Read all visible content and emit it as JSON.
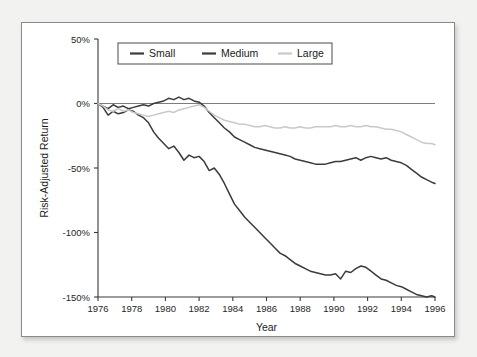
{
  "chart_data": {
    "type": "line",
    "title": "",
    "xlabel": "Year",
    "ylabel": "Risk-Adjusted Return",
    "xlim": [
      1976,
      1996
    ],
    "ylim": [
      -150,
      50
    ],
    "grid": false,
    "legend_position": "top-left-inside",
    "zero_reference_line": true,
    "x_ticks": [
      1976,
      1978,
      1980,
      1982,
      1984,
      1986,
      1988,
      1990,
      1992,
      1994,
      1996
    ],
    "x_tick_labels": [
      "1976",
      "1978",
      "1980",
      "1982",
      "1984",
      "1986",
      "1988",
      "1990",
      "1992",
      "1994",
      "1996"
    ],
    "y_ticks": [
      50,
      0,
      -50,
      -100,
      -150
    ],
    "y_tick_labels": [
      "50%",
      "0%",
      "-50%",
      "-100%",
      "-150%"
    ],
    "series": [
      {
        "name": "Small",
        "color": "#3b3b3b",
        "x": [
          1976.0,
          1976.3,
          1976.6,
          1976.9,
          1977.2,
          1977.5,
          1977.8,
          1978.1,
          1978.4,
          1978.7,
          1979.0,
          1979.3,
          1979.6,
          1979.9,
          1980.2,
          1980.5,
          1980.8,
          1981.1,
          1981.4,
          1981.7,
          1982.0,
          1982.3,
          1982.6,
          1982.9,
          1983.2,
          1983.5,
          1983.8,
          1984.1,
          1984.4,
          1984.7,
          1985.0,
          1985.3,
          1985.6,
          1985.9,
          1986.2,
          1986.5,
          1986.8,
          1987.1,
          1987.4,
          1987.7,
          1988.0,
          1988.3,
          1988.6,
          1988.9,
          1989.2,
          1989.5,
          1989.8,
          1990.1,
          1990.4,
          1990.7,
          1991.0,
          1991.3,
          1991.6,
          1991.9,
          1992.2,
          1992.5,
          1992.8,
          1993.1,
          1993.4,
          1993.7,
          1994.0,
          1994.3,
          1994.6,
          1994.9,
          1995.2,
          1995.5,
          1995.8,
          1996.0
        ],
        "y": [
          0,
          -3,
          -9,
          -6,
          -8,
          -7,
          -5,
          -6,
          -9,
          -11,
          -15,
          -22,
          -27,
          -31,
          -35,
          -33,
          -38,
          -44,
          -40,
          -42,
          -41,
          -45,
          -52,
          -50,
          -55,
          -62,
          -70,
          -78,
          -83,
          -88,
          -92,
          -96,
          -100,
          -104,
          -108,
          -112,
          -116,
          -118,
          -121,
          -124,
          -126,
          -128,
          -130,
          -131,
          -132,
          -133,
          -133,
          -132,
          -136,
          -130,
          -131,
          -128,
          -126,
          -127,
          -130,
          -133,
          -136,
          -137,
          -139,
          -141,
          -142,
          -144,
          -146,
          -148,
          -149,
          -150,
          -149,
          -150
        ]
      },
      {
        "name": "Medium",
        "color": "#3b3b3b",
        "x": [
          1976.0,
          1976.3,
          1976.6,
          1976.9,
          1977.2,
          1977.5,
          1977.8,
          1978.1,
          1978.4,
          1978.7,
          1979.0,
          1979.3,
          1979.6,
          1979.9,
          1980.2,
          1980.5,
          1980.8,
          1981.1,
          1981.4,
          1981.7,
          1982.0,
          1982.3,
          1982.6,
          1982.9,
          1983.2,
          1983.5,
          1983.8,
          1984.1,
          1984.4,
          1984.7,
          1985.0,
          1985.3,
          1985.6,
          1985.9,
          1986.2,
          1986.5,
          1986.8,
          1987.1,
          1987.4,
          1987.7,
          1988.0,
          1988.3,
          1988.6,
          1988.9,
          1989.2,
          1989.5,
          1989.8,
          1990.1,
          1990.4,
          1990.7,
          1991.0,
          1991.3,
          1991.6,
          1991.9,
          1992.2,
          1992.5,
          1992.8,
          1993.1,
          1993.4,
          1993.7,
          1994.0,
          1994.3,
          1994.6,
          1994.9,
          1995.2,
          1995.5,
          1995.8,
          1996.0
        ],
        "y": [
          0,
          -2,
          -4,
          -1,
          -3,
          -2,
          -4,
          -3,
          -2,
          -1,
          -2,
          0,
          1,
          2,
          4,
          3,
          5,
          3,
          4,
          2,
          1,
          -2,
          -7,
          -11,
          -15,
          -19,
          -22,
          -26,
          -28,
          -30,
          -32,
          -34,
          -35,
          -36,
          -37,
          -38,
          -39,
          -40,
          -41,
          -43,
          -44,
          -45,
          -46,
          -47,
          -47,
          -47,
          -46,
          -45,
          -45,
          -44,
          -43,
          -42,
          -44,
          -42,
          -41,
          -42,
          -43,
          -42,
          -44,
          -45,
          -46,
          -48,
          -51,
          -54,
          -57,
          -59,
          -61,
          -62
        ]
      },
      {
        "name": "Large",
        "color": "#c9c9c9",
        "x": [
          1976.0,
          1976.3,
          1976.6,
          1976.9,
          1977.2,
          1977.5,
          1977.8,
          1978.1,
          1978.4,
          1978.7,
          1979.0,
          1979.3,
          1979.6,
          1979.9,
          1980.2,
          1980.5,
          1980.8,
          1981.1,
          1981.4,
          1981.7,
          1982.0,
          1982.3,
          1982.6,
          1982.9,
          1983.2,
          1983.5,
          1983.8,
          1984.1,
          1984.4,
          1984.7,
          1985.0,
          1985.3,
          1985.6,
          1985.9,
          1986.2,
          1986.5,
          1986.8,
          1987.1,
          1987.4,
          1987.7,
          1988.0,
          1988.3,
          1988.6,
          1988.9,
          1989.2,
          1989.5,
          1989.8,
          1990.1,
          1990.4,
          1990.7,
          1991.0,
          1991.3,
          1991.6,
          1991.9,
          1992.2,
          1992.5,
          1992.8,
          1993.1,
          1993.4,
          1993.7,
          1994.0,
          1994.3,
          1994.6,
          1994.9,
          1995.2,
          1995.5,
          1995.8,
          1996.0
        ],
        "y": [
          0,
          -2,
          -5,
          -6,
          -4,
          -6,
          -5,
          -7,
          -8,
          -9,
          -10,
          -9,
          -8,
          -7,
          -6,
          -7,
          -5,
          -4,
          -3,
          -2,
          -1,
          -3,
          -6,
          -9,
          -11,
          -13,
          -14,
          -15,
          -16,
          -16,
          -17,
          -18,
          -18,
          -17,
          -18,
          -19,
          -19,
          -18,
          -19,
          -19,
          -18,
          -19,
          -19,
          -18,
          -18,
          -18,
          -18,
          -17,
          -18,
          -18,
          -17,
          -18,
          -18,
          -17,
          -18,
          -18,
          -19,
          -20,
          -20,
          -21,
          -22,
          -24,
          -26,
          -28,
          -30,
          -31,
          -31,
          -32
        ]
      }
    ],
    "legend": [
      {
        "label": "Small",
        "color": "#3b3b3b"
      },
      {
        "label": "Medium",
        "color": "#3b3b3b"
      },
      {
        "label": "Large",
        "color": "#c9c9c9"
      }
    ]
  }
}
